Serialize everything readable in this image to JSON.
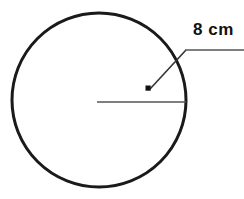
{
  "figure": {
    "background_color": "#ffffff",
    "stroke_color": "#1a1a1a",
    "radius_line_color": "#555555",
    "annotation": {
      "label": "8 cm",
      "value": 8,
      "unit": "cm",
      "measures": "radius"
    },
    "shape": {
      "type": "circle",
      "center_x": 99,
      "center_y": 100,
      "radius_px": 87,
      "stroke_width": 3
    },
    "radius_segment": {
      "from_x": 97,
      "from_y": 102,
      "to_x": 186,
      "to_y": 102,
      "stroke_width": 1.6
    },
    "point_marker": {
      "x": 148,
      "y": 88,
      "size": 5,
      "shape": "filled-square"
    },
    "leader_line": {
      "from_x": 150,
      "from_y": 89,
      "elbow_x": 186,
      "elbow_y": 50,
      "to_x": 244,
      "to_y": 50,
      "stroke_width": 1.6
    }
  }
}
